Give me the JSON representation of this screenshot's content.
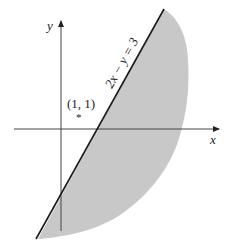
{
  "diagram": {
    "type": "inequality-region",
    "axes": {
      "x_label": "x",
      "y_label": "y"
    },
    "line": {
      "equation": "2x − y = 3"
    },
    "point": {
      "label": "(1, 1)",
      "marker": "*"
    },
    "shaded_region": "right/below of line 2x − y = 3",
    "colors": {
      "shade": "#c8c8c8",
      "line": "#1a1a1a",
      "axis": "#444444"
    }
  }
}
